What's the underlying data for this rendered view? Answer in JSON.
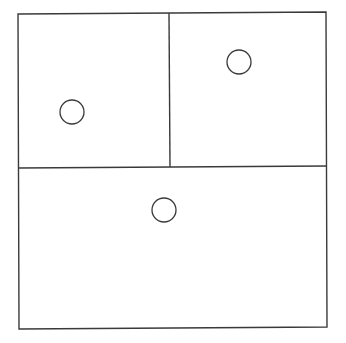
{
  "diagram": {
    "stroke_color": "#3a3a3a",
    "background": "#ffffff",
    "outer_box": {
      "points": "18,14 326,12 327,327 19,329"
    },
    "dividers": [
      {
        "name": "horizontal-divider",
        "x1": 18,
        "y1": 168,
        "x2": 327,
        "y2": 166
      },
      {
        "name": "vertical-divider",
        "x1": 169,
        "y1": 13,
        "x2": 170,
        "y2": 167
      }
    ],
    "regions": [
      {
        "name": "top-left-region",
        "circle": {
          "cx": 72,
          "cy": 112,
          "r": 12
        }
      },
      {
        "name": "top-right-region",
        "circle": {
          "cx": 239,
          "cy": 62,
          "r": 12
        }
      },
      {
        "name": "bottom-region",
        "circle": {
          "cx": 164,
          "cy": 210,
          "r": 12
        }
      }
    ]
  }
}
